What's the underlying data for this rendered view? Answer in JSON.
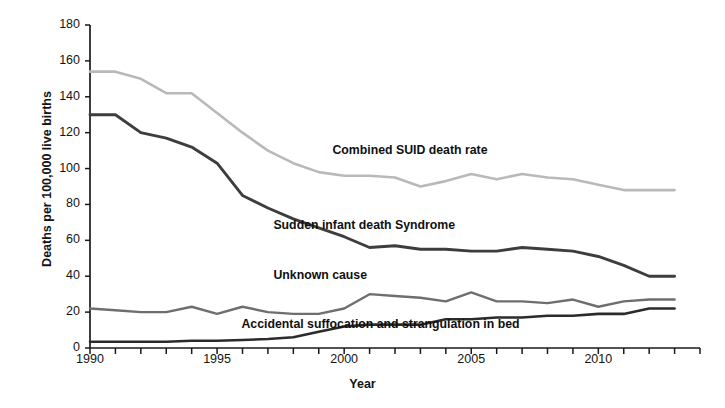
{
  "chart_data": {
    "type": "line",
    "title": "",
    "xlabel": "Year",
    "ylabel": "Deaths per 100,000 live births",
    "xlim": [
      1990,
      2014
    ],
    "ylim": [
      0,
      180
    ],
    "grid": false,
    "legend_position": "inline-annotations",
    "x": [
      1990,
      1991,
      1992,
      1993,
      1994,
      1995,
      1996,
      1997,
      1998,
      1999,
      2000,
      2001,
      2002,
      2003,
      2004,
      2005,
      2006,
      2007,
      2008,
      2009,
      2010,
      2011,
      2012,
      2013
    ],
    "yticks": [
      0,
      20,
      40,
      60,
      80,
      100,
      120,
      140,
      160,
      180
    ],
    "xticks_major": [
      1990,
      1995,
      2000,
      2005,
      2010
    ],
    "xtick_labels": [
      "1990",
      "1995",
      "2000",
      "2005",
      "2010"
    ],
    "series": [
      {
        "name": "Combined SUID death rate",
        "color": "#b9b9b9",
        "width": 2.6,
        "label_x": 2003.0,
        "label_y": 110,
        "values": [
          154,
          154,
          150,
          142,
          142,
          131,
          120,
          110,
          103,
          98,
          96,
          96,
          95,
          90,
          93,
          97,
          94,
          97,
          95,
          94,
          91,
          88,
          88,
          88
        ]
      },
      {
        "name": "Sudden infant death Syndrome",
        "color": "#3d3d3d",
        "width": 2.9,
        "label_x": 2000.6,
        "label_y": 68,
        "values": [
          130,
          130,
          120,
          117,
          112,
          103,
          85,
          78,
          72,
          67,
          62,
          56,
          57,
          55,
          55,
          54,
          54,
          56,
          55,
          54,
          51,
          46,
          40,
          40
        ]
      },
      {
        "name": "Unknown cause",
        "color": "#6e6e6e",
        "width": 2.4,
        "label_x": 2000.6,
        "label_y": 40,
        "values": [
          22,
          21,
          20,
          20,
          23,
          19,
          23,
          20,
          19,
          19,
          22,
          30,
          29,
          28,
          26,
          31,
          26,
          26,
          25,
          27,
          23,
          26,
          27,
          27
        ]
      },
      {
        "name": "Accidental suffocation and strangulation in bed",
        "color": "#2b2b2b",
        "width": 2.6,
        "label_x": 1999.5,
        "label_y": 13,
        "values": [
          3.5,
          3.5,
          3.5,
          3.5,
          4,
          4,
          4.5,
          5,
          6,
          9,
          12,
          13,
          13,
          13,
          16,
          16,
          17,
          17,
          18,
          18,
          19,
          19,
          22,
          22
        ]
      }
    ]
  }
}
